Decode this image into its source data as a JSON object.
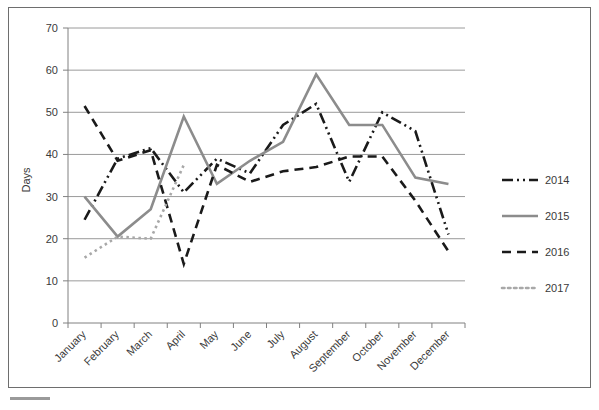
{
  "chart_data": {
    "type": "line",
    "title": "",
    "xlabel": "",
    "ylabel": "Days",
    "ylim": [
      0,
      70
    ],
    "ytick_step": 10,
    "yticks": [
      0,
      10,
      20,
      30,
      40,
      50,
      60,
      70
    ],
    "grid": "horizontal",
    "legend_position": "right",
    "categories": [
      "January",
      "February",
      "March",
      "April",
      "May",
      "June",
      "July",
      "August",
      "September",
      "October",
      "November",
      "December"
    ],
    "series": [
      {
        "name": "2014",
        "color": "#1a1a1a",
        "style": "dash-dot-dot",
        "dasharray": "11,4,2,4,2,4",
        "width": 2.6,
        "values": [
          24.5,
          39,
          41.5,
          31,
          39,
          35.5,
          47,
          52,
          33.5,
          50,
          45.5,
          21
        ]
      },
      {
        "name": "2015",
        "color": "#8c8c8c",
        "style": "solid",
        "dasharray": "",
        "width": 2.6,
        "values": [
          30,
          20.5,
          27,
          49,
          33,
          38.5,
          43,
          59,
          47,
          47,
          34.5,
          33
        ]
      },
      {
        "name": "2016",
        "color": "#1a1a1a",
        "style": "dashed",
        "dasharray": "9,6",
        "width": 2.6,
        "values": [
          51.5,
          38.5,
          41,
          14,
          37.5,
          33.5,
          36,
          37,
          39.5,
          39.5,
          29,
          17
        ]
      },
      {
        "name": "2017",
        "color": "#a8a8a8",
        "style": "dotted",
        "dasharray": "2.5,3.5",
        "width": 2.6,
        "values": [
          15.5,
          20.5,
          20,
          37.5,
          null,
          null,
          null,
          null,
          null,
          null,
          null,
          null
        ]
      }
    ]
  },
  "legend": {
    "entries": [
      {
        "label": "2014"
      },
      {
        "label": "2015"
      },
      {
        "label": "2016"
      },
      {
        "label": "2017"
      }
    ]
  }
}
